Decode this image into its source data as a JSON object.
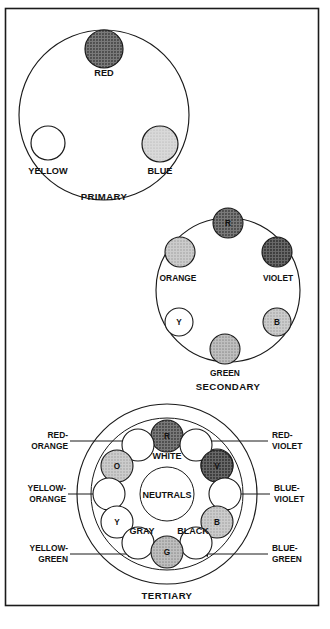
{
  "figure": {
    "background": "#ffffff",
    "line_color": "#1a1a1a"
  },
  "swatch_colors": {
    "white": "#ffffff",
    "light_gray": "#c9c9c9",
    "medium_light_gray": "#b4b4b4",
    "medium_gray": "#a8a8a8",
    "dark_gray": "#6e6e6e",
    "darker_gray": "#5a5a5a"
  },
  "primary": {
    "caption": "PRIMARY",
    "swatches": [
      {
        "label": "RED",
        "tone": "dark_gray",
        "label_pos": "below"
      },
      {
        "label": "YELLOW",
        "tone": "white",
        "label_pos": "below"
      },
      {
        "label": "BLUE",
        "tone": "light_gray",
        "label_pos": "below"
      }
    ]
  },
  "secondary": {
    "caption": "SECONDARY",
    "swatches": [
      {
        "label": "R",
        "tone": "dark_gray",
        "label_pos": "inside"
      },
      {
        "label": "ORANGE",
        "tone": "medium_light_gray",
        "label_pos": "below"
      },
      {
        "label": "VIOLET",
        "tone": "darker_gray",
        "label_pos": "below"
      },
      {
        "label": "Y",
        "tone": "white",
        "label_pos": "inside"
      },
      {
        "label": "B",
        "tone": "medium_light_gray",
        "label_pos": "inside"
      },
      {
        "label": "GREEN",
        "tone": "medium_gray",
        "label_pos": "below"
      }
    ]
  },
  "tertiary": {
    "caption": "TERTIARY",
    "center": {
      "above_label": "WHITE",
      "inner_label": "NEUTRALS",
      "below_left_label": "GRAY",
      "below_right_label": "BLACK"
    },
    "ring_swatches": [
      {
        "label": "R",
        "tone": "dark_gray",
        "show_label": true
      },
      {
        "label": "",
        "tone": "white",
        "show_label": false
      },
      {
        "label": "V",
        "tone": "darker_gray",
        "show_label": true
      },
      {
        "label": "",
        "tone": "white",
        "show_label": false
      },
      {
        "label": "B",
        "tone": "medium_light_gray",
        "show_label": true
      },
      {
        "label": "",
        "tone": "white",
        "show_label": false
      },
      {
        "label": "G",
        "tone": "medium_gray",
        "show_label": true
      },
      {
        "label": "",
        "tone": "white",
        "show_label": false
      },
      {
        "label": "Y",
        "tone": "white",
        "show_label": true
      },
      {
        "label": "",
        "tone": "white",
        "show_label": false
      },
      {
        "label": "O",
        "tone": "medium_light_gray",
        "show_label": true
      },
      {
        "label": "",
        "tone": "white",
        "show_label": false
      }
    ],
    "callouts": [
      {
        "line1": "RED-",
        "line2": "ORANGE",
        "side": "left"
      },
      {
        "line1": "YELLOW-",
        "line2": "ORANGE",
        "side": "left"
      },
      {
        "line1": "YELLOW-",
        "line2": "GREEN",
        "side": "left"
      },
      {
        "line1": "RED-",
        "line2": "VIOLET",
        "side": "right"
      },
      {
        "line1": "BLUE-",
        "line2": "VIOLET",
        "side": "right"
      },
      {
        "line1": "BLUE-",
        "line2": "GREEN",
        "side": "right"
      }
    ]
  }
}
